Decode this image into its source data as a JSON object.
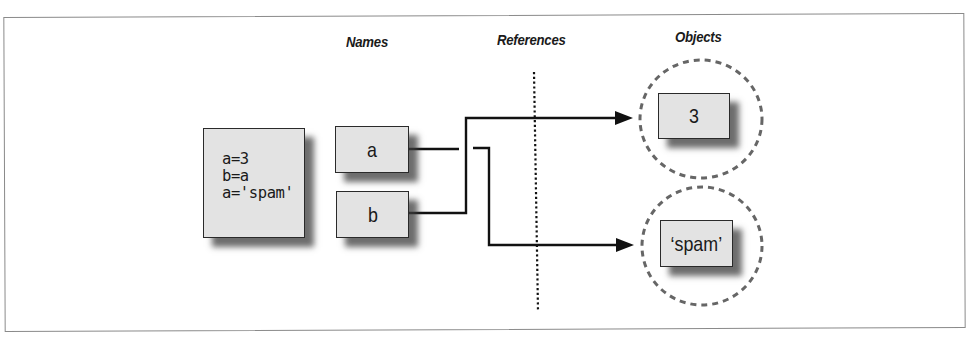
{
  "headings": {
    "names": "Names",
    "references": "References",
    "objects": "Objects"
  },
  "code_box": {
    "lines": [
      "a=3",
      "b=a",
      "a='spam'"
    ]
  },
  "names": [
    {
      "label": "a"
    },
    {
      "label": "b"
    }
  ],
  "objects": [
    {
      "label": "3"
    },
    {
      "label": "‘spam’"
    }
  ],
  "links": [
    {
      "from": "a",
      "to": "‘spam’",
      "note": "a's old link to 3 is broken"
    },
    {
      "from": "b",
      "to": "3"
    }
  ],
  "colors": {
    "box_fill": "#e3e3e3",
    "box_border": "#2a2a2a",
    "line": "#111111",
    "dashed_circle": "#666666",
    "frame": "#8a8a8a"
  }
}
